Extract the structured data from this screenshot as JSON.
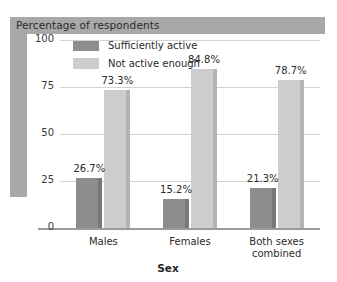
{
  "chart_data": {
    "type": "bar",
    "title": "Percentage of respondents",
    "xlabel": "Sex",
    "ylabel": "",
    "categories": [
      "Males",
      "Females",
      "Both sexes\ncombined"
    ],
    "series": [
      {
        "name": "Sufficiently active",
        "color": "#8d8d8d",
        "values": [
          26.7,
          15.2,
          21.3
        ],
        "labels": [
          "26.7%",
          "15.2%",
          "21.3%"
        ]
      },
      {
        "name": "Not active enough",
        "color": "#cdcdcd",
        "values": [
          73.3,
          84.8,
          78.7
        ],
        "labels": [
          "73.3%",
          "84.8%",
          "78.7%"
        ]
      }
    ],
    "ylim": [
      0,
      100
    ],
    "yticks": [
      0,
      25,
      50,
      75,
      100
    ],
    "ytick_labels": [
      "0",
      "25",
      "50",
      "75",
      "100"
    ],
    "grid": true,
    "legend_position": "top-left-inside"
  },
  "colors": {
    "band": "#a8a8a8",
    "gridline": "#d2d2d2",
    "axis": "#9a9a9a",
    "text": "#2b2b2b",
    "series_dark": "#8d8d8d",
    "series_light": "#cdcdcd",
    "series_dark_side": "#787878",
    "series_light_side": "#b4b4b4"
  }
}
